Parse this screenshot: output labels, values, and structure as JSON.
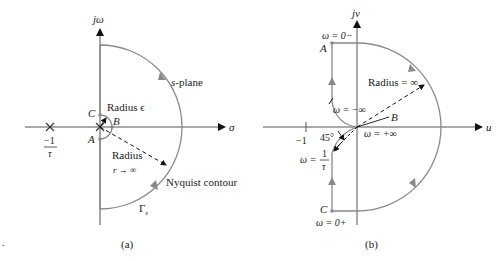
{
  "figure": {
    "stray_mark": ".",
    "panel_a": {
      "caption": "(a)",
      "axes": {
        "vertical": "jω",
        "horizontal": "σ"
      },
      "pole_label": {
        "numerator": "−1",
        "denominator": "τ"
      },
      "points": {
        "A": "A",
        "B": "B",
        "C": "C"
      },
      "labels": {
        "small_radius": "Radius ϵ",
        "plane": "s-plane",
        "large_radius_title": "Radius",
        "large_radius_limit": "r → ∞",
        "contour": "Nyquist contour",
        "gamma": "Γ",
        "gamma_sub": "s"
      }
    },
    "panel_b": {
      "caption": "(b)",
      "axes": {
        "vertical": "jv",
        "horizontal": "u"
      },
      "tick_label": "−1",
      "points": {
        "A": "A",
        "B": "B",
        "C": "C"
      },
      "labels": {
        "w_top": "ω = 0−",
        "w_bottom": "ω = 0+",
        "w_neg_inf": "ω = −∞",
        "w_pos_inf": "ω = +∞",
        "radius_inf": "Radius = ∞",
        "angle": "45°",
        "w_tau_prefix": "ω =",
        "w_tau_num": "1",
        "w_tau_den": "τ"
      }
    },
    "colors": {
      "contour": "#8a8a8a",
      "axis": "#555555",
      "text": "#222222",
      "arrow": "#111111"
    }
  }
}
